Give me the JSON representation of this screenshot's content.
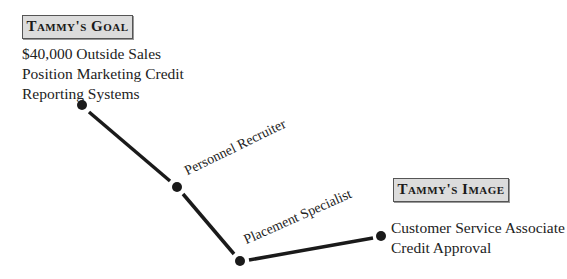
{
  "goal": {
    "title": "Tammy's Goal",
    "lines": [
      "$40,000 Outside Sales",
      "Position Marketing Credit",
      "Reporting Systems"
    ]
  },
  "image": {
    "title": "Tammy's Image",
    "lines": [
      "Customer Service Associate",
      "Credit Approval"
    ]
  },
  "path": {
    "nodes": [
      {
        "x": 82,
        "y": 105
      },
      {
        "x": 177,
        "y": 187
      },
      {
        "x": 240,
        "y": 261
      },
      {
        "x": 381,
        "y": 236
      }
    ],
    "labels": [
      "Personnel Recruiter",
      "Placement Specialist"
    ],
    "color": "#1a1a1a"
  }
}
